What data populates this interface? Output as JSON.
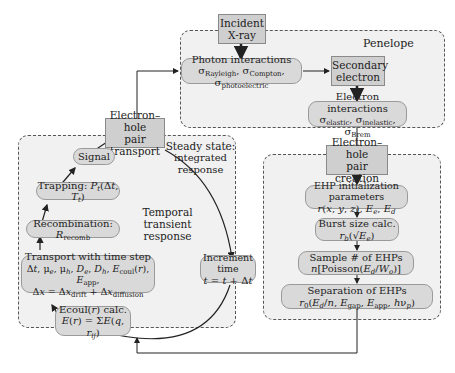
{
  "regions": {
    "penelope": {
      "label": "Penelope"
    },
    "transport": {
      "label_line1": "Steady state:",
      "label_line2": "integrated response",
      "center_line1": "Temporal",
      "center_line2": "transient response"
    },
    "creation": {}
  },
  "boxes": {
    "incident_xray": {
      "line1": "Incident",
      "line2": "X-ray"
    },
    "photon_interactions": {
      "line1": "Photon interactions",
      "line2": "σRayleigh, σCompton, σphotoelectric"
    },
    "secondary_electron": {
      "line1": "Secondary",
      "line2": "electron"
    },
    "electron_interactions": {
      "line1": "Electron interactions",
      "line2": "σelastic, σinelastic, σBrem"
    },
    "ehp_transport": {
      "line1": "Electron–hole",
      "line2": "pair transport"
    },
    "ehp_creation": {
      "line1": "Electron–hole",
      "line2": "pair creation"
    },
    "signal": {
      "line1": "Signal"
    },
    "trapping": {
      "line1": "Trapping: Pt(Δt, Tt)"
    },
    "recombination": {
      "line1": "Recombination: Rrecomb"
    },
    "transport_step": {
      "line1": "Transport with time step",
      "line2": "Δt, μe, μh, De, Dh, Ecoul(r), Eapp,",
      "line3": "Δx = Δxdrift + Δxdiffusion"
    },
    "ecoul_calc": {
      "line1": "Ecoul(r) calc.",
      "line2": "E(r) = ΣE(q, rij)"
    },
    "increment_time": {
      "line1": "Increment time",
      "line2": "t = t + Δt"
    },
    "ehp_init": {
      "line1": "EHP initialization parameters",
      "line2": "r(x, y, z), Ee, Ed"
    },
    "burst_size": {
      "line1": "Burst size calc.",
      "line2": "rb(√Ee)"
    },
    "sample_ehps": {
      "line1": "Sample # of EHPs",
      "line2": "n[Poisson(Ed/Wo)]"
    },
    "separation": {
      "line1": "Separation of EHPs",
      "line2": "r0(Ed/n, Egap, Eapp, hνp)"
    }
  },
  "colors": {
    "region_bg": "#f1f1f1",
    "square_box": "#cfcfcf",
    "rounded_box": "#d9d9d9",
    "border": "#555555"
  }
}
